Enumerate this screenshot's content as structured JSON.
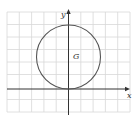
{
  "figure": {
    "x_axis_label": "x",
    "y_axis_label": "y",
    "region_label": "G",
    "grid": {
      "columns": 10,
      "rows": 8
    },
    "circle": {
      "center": [
        0,
        2.6
      ],
      "radius": 2.6,
      "tangent_to": "x-axis at origin"
    }
  },
  "colors": {
    "grid": "#d8d8d8",
    "axis": "#333333",
    "circle": "#555555",
    "background": "#ffffff"
  }
}
